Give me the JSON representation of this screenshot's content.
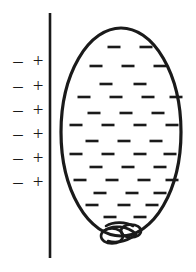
{
  "figure": {
    "background_color": "#ffffff",
    "ink_color": "#1a1a1a",
    "width": 196,
    "height": 272
  },
  "wall": {
    "label": "wall-surface-line",
    "x": 50,
    "y_top": 13,
    "y_bottom": 258,
    "stroke_width": 2.6,
    "color": "#1a1a1a"
  },
  "wall_charges": {
    "description": "Six rows of induced surface charge pairs, negative on the outer side and positive adjacent to the wall",
    "negative_symbol": "–",
    "positive_symbol": "+",
    "row_count": 6,
    "negative_x": 18,
    "positive_x": 38,
    "rows_y": [
      63,
      88,
      112,
      136,
      160,
      184
    ]
  },
  "balloon": {
    "label": "charged-balloon",
    "center_x": 121,
    "center_y": 132,
    "radius_x": 60,
    "radius_y": 104,
    "stroke_width": 3.2,
    "fill": "#ffffff",
    "color": "#1a1a1a"
  },
  "balloon_knot": {
    "label": "balloon-knot",
    "center_x": 120,
    "center_y": 233,
    "width": 34,
    "height": 21,
    "stroke_width": 2.6,
    "color": "#1a1a1a"
  },
  "balloon_charges": {
    "description": "Negative charge dashes distributed across the interior of the balloon",
    "symbol": "–",
    "dash_length": 13,
    "dash_thickness": 2.6,
    "count": 40,
    "positions": [
      [
        114,
        47
      ],
      [
        146,
        47
      ],
      [
        96,
        66
      ],
      [
        128,
        66
      ],
      [
        160,
        66
      ],
      [
        106,
        84
      ],
      [
        140,
        84
      ],
      [
        84,
        97
      ],
      [
        116,
        97
      ],
      [
        148,
        97
      ],
      [
        176,
        97
      ],
      [
        94,
        113
      ],
      [
        126,
        113
      ],
      [
        158,
        113
      ],
      [
        76,
        125
      ],
      [
        108,
        125
      ],
      [
        140,
        125
      ],
      [
        172,
        125
      ],
      [
        92,
        141
      ],
      [
        124,
        141
      ],
      [
        156,
        141
      ],
      [
        76,
        154
      ],
      [
        108,
        154
      ],
      [
        140,
        154
      ],
      [
        170,
        154
      ],
      [
        96,
        167
      ],
      [
        128,
        167
      ],
      [
        160,
        167
      ],
      [
        80,
        180
      ],
      [
        112,
        180
      ],
      [
        144,
        180
      ],
      [
        172,
        180
      ],
      [
        100,
        193
      ],
      [
        132,
        193
      ],
      [
        160,
        193
      ],
      [
        92,
        205
      ],
      [
        124,
        205
      ],
      [
        152,
        205
      ],
      [
        110,
        217
      ],
      [
        140,
        217
      ]
    ]
  }
}
